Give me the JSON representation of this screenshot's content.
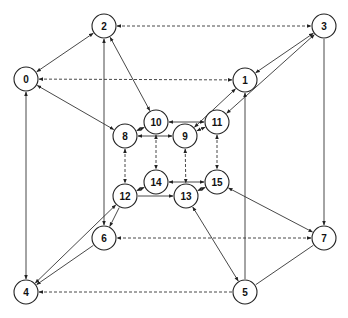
{
  "diagram": {
    "type": "directed-graph",
    "node_radius": 12,
    "colors": {
      "stroke": "#333333",
      "node_fill": "#ffffff",
      "text": "#111111",
      "background": "#ffffff"
    },
    "nodes": [
      {
        "id": "0",
        "label": "0",
        "x": 26,
        "y": 79
      },
      {
        "id": "1",
        "label": "1",
        "x": 245,
        "y": 80
      },
      {
        "id": "2",
        "label": "2",
        "x": 104,
        "y": 26
      },
      {
        "id": "3",
        "label": "3",
        "x": 324,
        "y": 26
      },
      {
        "id": "4",
        "label": "4",
        "x": 26,
        "y": 292
      },
      {
        "id": "5",
        "label": "5",
        "x": 245,
        "y": 292
      },
      {
        "id": "6",
        "label": "6",
        "x": 104,
        "y": 238
      },
      {
        "id": "7",
        "label": "7",
        "x": 324,
        "y": 238
      },
      {
        "id": "8",
        "label": "8",
        "x": 125,
        "y": 136
      },
      {
        "id": "9",
        "label": "9",
        "x": 185,
        "y": 136
      },
      {
        "id": "10",
        "label": "10",
        "x": 156,
        "y": 122
      },
      {
        "id": "11",
        "label": "11",
        "x": 217,
        "y": 122
      },
      {
        "id": "12",
        "label": "12",
        "x": 125,
        "y": 196
      },
      {
        "id": "13",
        "label": "13",
        "x": 186,
        "y": 196
      },
      {
        "id": "14",
        "label": "14",
        "x": 156,
        "y": 182
      },
      {
        "id": "15",
        "label": "15",
        "x": 217,
        "y": 182
      }
    ],
    "edges": [
      {
        "from": "2",
        "to": "3",
        "style": "dashed",
        "arrows": "both"
      },
      {
        "from": "1",
        "to": "0",
        "style": "dashed",
        "arrows": "both"
      },
      {
        "from": "7",
        "to": "6",
        "style": "dashed",
        "arrows": "both"
      },
      {
        "from": "5",
        "to": "4",
        "style": "dashed",
        "arrows": "end"
      },
      {
        "from": "8",
        "to": "12",
        "style": "dashed",
        "arrows": "both"
      },
      {
        "from": "10",
        "to": "14",
        "style": "dashed",
        "arrows": "both"
      },
      {
        "from": "9",
        "to": "13",
        "style": "dashed",
        "arrows": "both"
      },
      {
        "from": "11",
        "to": "15",
        "style": "dashed",
        "arrows": "both"
      },
      {
        "from": "0",
        "to": "2",
        "style": "solid",
        "arrows": "both"
      },
      {
        "from": "0",
        "to": "8",
        "style": "solid",
        "arrows": "both"
      },
      {
        "from": "0",
        "to": "4",
        "style": "solid",
        "arrows": "both"
      },
      {
        "from": "2",
        "to": "10",
        "style": "solid",
        "arrows": "both"
      },
      {
        "from": "6",
        "to": "2",
        "style": "solid",
        "arrows": "both"
      },
      {
        "from": "3",
        "to": "1",
        "style": "solid",
        "arrows": "both"
      },
      {
        "from": "11",
        "to": "3",
        "style": "solid",
        "arrows": "both"
      },
      {
        "from": "3",
        "to": "7",
        "style": "solid",
        "arrows": "end"
      },
      {
        "from": "5",
        "to": "1",
        "style": "solid",
        "arrows": "end"
      },
      {
        "from": "9",
        "to": "1",
        "style": "solid",
        "arrows": "both"
      },
      {
        "from": "8",
        "to": "10",
        "style": "solid",
        "arrows": "both"
      },
      {
        "from": "8",
        "to": "9",
        "style": "solid",
        "arrows": "both"
      },
      {
        "from": "11",
        "to": "10",
        "style": "solid",
        "arrows": "both"
      },
      {
        "from": "9",
        "to": "11",
        "style": "solid",
        "arrows": "both"
      },
      {
        "from": "12",
        "to": "14",
        "style": "solid",
        "arrows": "both"
      },
      {
        "from": "12",
        "to": "13",
        "style": "solid",
        "arrows": "end"
      },
      {
        "from": "14",
        "to": "15",
        "style": "solid",
        "arrows": "both"
      },
      {
        "from": "13",
        "to": "15",
        "style": "solid",
        "arrows": "both"
      },
      {
        "from": "4",
        "to": "12",
        "style": "solid",
        "arrows": "both"
      },
      {
        "from": "12",
        "to": "6",
        "style": "solid",
        "arrows": "end"
      },
      {
        "from": "6",
        "to": "4",
        "style": "solid",
        "arrows": "end"
      },
      {
        "from": "15",
        "to": "7",
        "style": "solid",
        "arrows": "both"
      },
      {
        "from": "13",
        "to": "5",
        "style": "solid",
        "arrows": "both"
      },
      {
        "from": "5",
        "to": "7",
        "style": "solid",
        "arrows": "none"
      }
    ]
  }
}
